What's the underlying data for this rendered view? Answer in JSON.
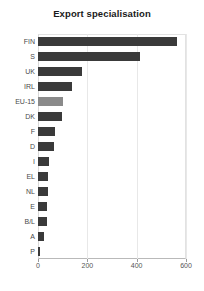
{
  "chart_data": {
    "type": "bar",
    "orientation": "horizontal",
    "title": "Export specialisation",
    "subtitle": "",
    "xlabel": "",
    "ylabel": "",
    "xlim": [
      0,
      600
    ],
    "xticks": [
      0,
      200,
      400,
      600
    ],
    "xtick_labels": [
      "0",
      "200",
      "400",
      "600"
    ],
    "grid": true,
    "grid_axis": "x",
    "legend": "none",
    "categories": [
      "FIN",
      "S",
      "UK",
      "IRL",
      "EU-15",
      "DK",
      "F",
      "D",
      "I",
      "EL",
      "NL",
      "E",
      "B/L",
      "A",
      "P"
    ],
    "values": [
      563,
      413,
      178,
      138,
      101,
      97,
      69,
      65,
      45,
      40,
      40,
      36,
      36,
      24,
      5
    ],
    "series": [
      {
        "name": "Export specialisation",
        "values": [
          563,
          413,
          178,
          138,
          101,
          97,
          69,
          65,
          45,
          40,
          40,
          36,
          36,
          24,
          5
        ]
      }
    ],
    "bar_colors": [
      "#3a3a3a",
      "#3a3a3a",
      "#3a3a3a",
      "#3a3a3a",
      "#8a8a8a",
      "#3a3a3a",
      "#3a3a3a",
      "#3a3a3a",
      "#3a3a3a",
      "#3a3a3a",
      "#3a3a3a",
      "#3a3a3a",
      "#3a3a3a",
      "#3a3a3a",
      "#3a3a3a"
    ],
    "highlight_category": "EU-15",
    "colors": {
      "bar_default": "#3a3a3a",
      "bar_highlight": "#8a8a8a",
      "grid": "#e8e8e8",
      "axis": "#b9b9b9",
      "text": "#4a4a4a",
      "title": "#1a1a1a",
      "background": "#ffffff"
    }
  }
}
